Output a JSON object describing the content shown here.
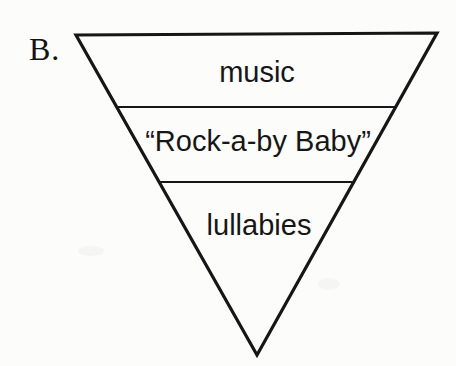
{
  "figure_label": "B.",
  "diagram": {
    "type": "inverted-triangle-hierarchy",
    "levels": [
      {
        "label": "music"
      },
      {
        "label": "“Rock-a-by Baby”"
      },
      {
        "label": "lullabies"
      }
    ]
  },
  "colors": {
    "line": "#161616",
    "text": "#141414",
    "background": "#fcfcfb"
  }
}
